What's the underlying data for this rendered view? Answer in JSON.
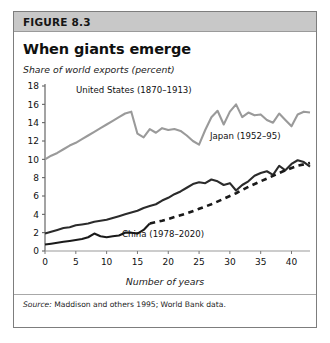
{
  "figure": {
    "number_label": "FIGURE 8.3",
    "title": "When giants emerge",
    "unit_caption": "Share of world exports\n(percent)",
    "source_lead": "Source:",
    "source_text": " Maddison and others 1995; World Bank data."
  },
  "chart_data": {
    "type": "line",
    "title": "When giants emerge",
    "subtitle": "Share of world exports (percent)",
    "xlabel": "Number of years",
    "ylabel": "Share of world exports (percent)",
    "xlim": [
      0,
      43
    ],
    "ylim": [
      0,
      18
    ],
    "xticks": [
      0,
      5,
      10,
      15,
      20,
      25,
      30,
      35,
      40
    ],
    "yticks": [
      0,
      2,
      4,
      6,
      8,
      10,
      12,
      14,
      16,
      18
    ],
    "grid": false,
    "legend_position": "inline-annotations",
    "annotations": [
      {
        "text": "United States (1870–1913)",
        "series": "United States"
      },
      {
        "text": "Japan (1952–95)",
        "series": "Japan"
      },
      {
        "text": "China (1978–2020)",
        "series": "China"
      }
    ],
    "series": [
      {
        "name": "United States",
        "label": "United States (1870–1913)",
        "color": "#9a9a9a",
        "style": "solid",
        "x": [
          0,
          1,
          2,
          3,
          4,
          5,
          6,
          7,
          8,
          9,
          10,
          11,
          12,
          13,
          14,
          15,
          16,
          17,
          18,
          19,
          20,
          21,
          22,
          23,
          24,
          25,
          26,
          27,
          28,
          29,
          30,
          31,
          32,
          33,
          34,
          35,
          36,
          37,
          38,
          39,
          40,
          41,
          42,
          43
        ],
        "y": [
          10.0,
          10.4,
          10.7,
          11.1,
          11.5,
          11.8,
          12.2,
          12.6,
          13.0,
          13.4,
          13.8,
          14.2,
          14.6,
          15.0,
          15.2,
          12.8,
          12.4,
          13.3,
          12.9,
          13.4,
          13.2,
          13.3,
          13.1,
          12.6,
          12.0,
          11.6,
          13.2,
          14.6,
          15.3,
          13.8,
          15.2,
          16.0,
          14.6,
          15.1,
          14.8,
          14.9,
          14.3,
          14.0,
          15.0,
          14.3,
          13.6,
          14.9,
          15.2,
          15.1
        ]
      },
      {
        "name": "Japan",
        "label": "Japan (1952–95)",
        "color": "#2b2b2b",
        "style": "solid",
        "x": [
          0,
          1,
          2,
          3,
          4,
          5,
          6,
          7,
          8,
          9,
          10,
          11,
          12,
          13,
          14,
          15,
          16,
          17,
          18,
          19,
          20,
          21,
          22,
          23,
          24,
          25,
          26,
          27,
          28,
          29,
          30,
          31,
          32,
          33,
          34,
          35,
          36,
          37,
          38,
          39,
          40,
          41,
          42,
          43
        ],
        "y": [
          1.9,
          2.1,
          2.3,
          2.5,
          2.6,
          2.8,
          2.9,
          3.0,
          3.2,
          3.3,
          3.4,
          3.6,
          3.8,
          4.0,
          4.2,
          4.4,
          4.7,
          4.9,
          5.1,
          5.5,
          5.8,
          6.2,
          6.5,
          6.9,
          7.3,
          7.5,
          7.4,
          7.8,
          7.6,
          7.2,
          7.4,
          6.6,
          7.2,
          7.6,
          8.2,
          8.5,
          8.7,
          8.3,
          9.3,
          8.8,
          9.5,
          9.9,
          9.7,
          9.2
        ]
      },
      {
        "name": "China (actual)",
        "label": "China (1978–2020)",
        "color": "#1a1a1a",
        "style": "solid",
        "x": [
          0,
          1,
          2,
          3,
          4,
          5,
          6,
          7,
          8,
          9,
          10,
          11,
          12,
          13,
          14,
          15,
          16,
          17
        ],
        "y": [
          0.7,
          0.8,
          0.9,
          1.0,
          1.1,
          1.2,
          1.3,
          1.5,
          1.9,
          1.6,
          1.5,
          1.6,
          1.7,
          2.0,
          2.0,
          1.9,
          2.3,
          3.0
        ]
      },
      {
        "name": "China (projected)",
        "label": "China (1978–2020)",
        "color": "#1a1a1a",
        "style": "dashed",
        "x": [
          17,
          19,
          21,
          23,
          25,
          27,
          29,
          31,
          33,
          35,
          37,
          39,
          41,
          43
        ],
        "y": [
          3.0,
          3.3,
          3.7,
          4.1,
          4.6,
          5.1,
          5.7,
          6.3,
          7.0,
          7.6,
          8.2,
          8.8,
          9.3,
          9.6
        ]
      }
    ]
  }
}
